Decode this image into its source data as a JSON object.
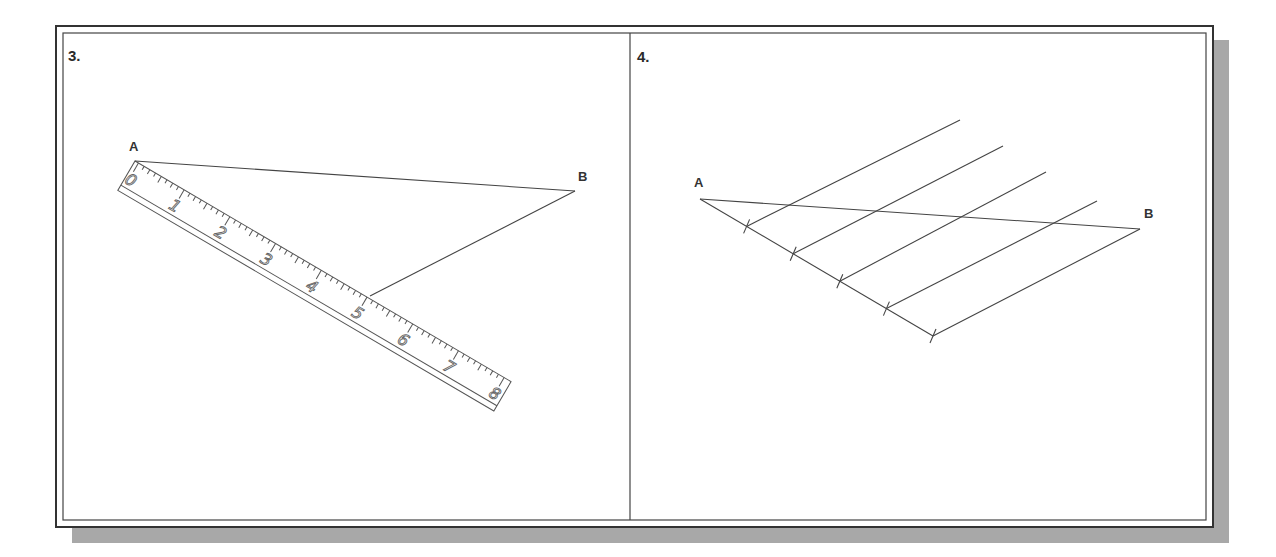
{
  "figure": {
    "colors": {
      "line": "#444444",
      "frame": "#333333",
      "shadow": "#a8a8a8",
      "background": "#ffffff"
    },
    "panels": [
      {
        "id": "3",
        "label": "3.",
        "points": {
          "A": "A",
          "B": "B"
        },
        "ruler": {
          "numbers": [
            "0",
            "1",
            "2",
            "3",
            "4",
            "5",
            "6",
            "7",
            "8"
          ]
        }
      },
      {
        "id": "4",
        "label": "4.",
        "points": {
          "A": "A",
          "B": "B"
        },
        "divisions": 5
      }
    ]
  }
}
